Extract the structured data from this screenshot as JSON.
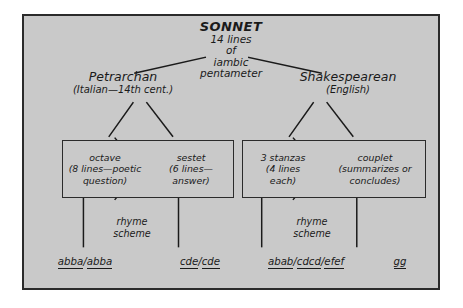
{
  "diagram": {
    "title": "SONNET",
    "subtitle": "14 lines\nof\niambic\npentameter",
    "background_color": "#c9c9c9",
    "ink_color": "#1a1a1a",
    "branches": [
      {
        "name": "Petrarchan",
        "origin": "(Italian—14th cent.)",
        "parts": [
          {
            "label": "octave",
            "detail": "(8 lines—poetic\nquestion)"
          },
          {
            "label": "sestet",
            "detail": "(6 lines—\nanswer)"
          }
        ],
        "connector_label": "rhyme\nscheme",
        "schemes": [
          {
            "groups": [
              "abba",
              "abba"
            ],
            "separator": "/"
          },
          {
            "groups": [
              "cde",
              "cde"
            ],
            "separator": "/"
          }
        ]
      },
      {
        "name": "Shakespearean",
        "origin": "(English)",
        "parts": [
          {
            "label": "3 stanzas",
            "detail": "(4 lines\neach)"
          },
          {
            "label": "couplet",
            "detail": "(summarizes or\nconcludes)"
          }
        ],
        "connector_label": "rhyme\nscheme",
        "schemes": [
          {
            "groups": [
              "abab",
              "cdcd",
              "efef"
            ],
            "separator": "/"
          },
          {
            "groups": [
              "gg"
            ],
            "separator": "/"
          }
        ]
      }
    ]
  },
  "text": {
    "sonnet": "SONNET",
    "sonnet_sub": "14 lines\nof\niambic\npentameter",
    "petrarchan": "Petrarchan",
    "petrarchan_sub": "(Italian—14th cent.)",
    "shakespearean": "Shakespearean",
    "shakespearean_sub": "(English)",
    "octave": "octave\n(8 lines—poetic\nquestion)",
    "sestet": "sestet\n(6 lines—\nanswer)",
    "stanzas": "3 stanzas\n(4 lines\neach)",
    "couplet": "couplet\n(summarizes or\nconcludes)",
    "rhyme_scheme_left": "rhyme\nscheme",
    "rhyme_scheme_right": "rhyme\nscheme"
  }
}
